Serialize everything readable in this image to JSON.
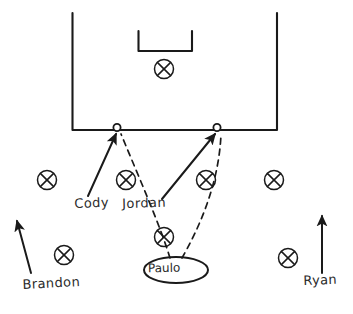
{
  "diagram": {
    "style": "hand-drawn whiteboard sketch",
    "ink_color": "#1a1a1a",
    "background_color": "#ffffff",
    "width": 353,
    "height": 314
  },
  "field": {
    "penalty_box": {
      "x": 72,
      "y": 13,
      "width": 205,
      "height": 117,
      "open_side": "top"
    },
    "goal_box": {
      "x": 138,
      "y": 31,
      "width": 54,
      "height": 20,
      "open_side": "top"
    }
  },
  "labels": {
    "cody": "Cody",
    "jordan": "Jordan",
    "brandon": "Brandon",
    "ryan": "Ryan",
    "paulo": "Paulo"
  },
  "players": [
    {
      "id": "x-goal-area",
      "marker": "circled-x",
      "cx": 164,
      "cy": 69,
      "label": ""
    },
    {
      "id": "x-left-wing",
      "marker": "circled-x",
      "cx": 47,
      "cy": 180,
      "label": ""
    },
    {
      "id": "x-cody",
      "marker": "circled-x",
      "cx": 126,
      "cy": 180,
      "label": "Cody"
    },
    {
      "id": "x-jordan",
      "marker": "circled-x",
      "cx": 206,
      "cy": 180,
      "label": "Jordan"
    },
    {
      "id": "x-right-wing",
      "marker": "circled-x",
      "cx": 274,
      "cy": 180,
      "label": ""
    },
    {
      "id": "x-center",
      "marker": "circled-x",
      "cx": 164,
      "cy": 237,
      "label": ""
    },
    {
      "id": "x-brandon",
      "marker": "circled-x",
      "cx": 64,
      "cy": 255,
      "label": "Brandon"
    },
    {
      "id": "x-ryan",
      "marker": "circled-x",
      "cx": 288,
      "cy": 258,
      "label": "Ryan"
    }
  ],
  "cones": [
    {
      "id": "cone-left",
      "cx": 117,
      "cy": 128
    },
    {
      "id": "cone-right",
      "cx": 217,
      "cy": 128
    }
  ],
  "highlight": {
    "id": "paulo-oval",
    "label": "Paulo",
    "cx": 176,
    "cy": 270,
    "rx": 32,
    "ry": 13
  },
  "movement_arrows": [
    {
      "id": "arrow-cody-run",
      "from": [
        88,
        196
      ],
      "to": [
        116,
        133
      ],
      "style": "solid"
    },
    {
      "id": "arrow-jordan-run",
      "from": [
        162,
        199
      ],
      "to": [
        215,
        133
      ],
      "style": "solid"
    },
    {
      "id": "arrow-brandon-run",
      "from": [
        31,
        273
      ],
      "to": [
        17,
        221
      ],
      "style": "solid"
    },
    {
      "id": "arrow-ryan-run",
      "from": [
        322,
        273
      ],
      "to": [
        322,
        215
      ],
      "style": "solid"
    }
  ],
  "pass_paths": [
    {
      "id": "pass-paulo-to-left-cone",
      "style": "dashed",
      "from": [
        170,
        258
      ],
      "to": [
        120,
        134
      ]
    },
    {
      "id": "pass-paulo-to-right-cone",
      "style": "dashed",
      "from": [
        182,
        258
      ],
      "to": [
        221,
        134
      ]
    }
  ],
  "legend": {
    "circled_x_meaning": "player position",
    "small_circle_meaning": "cone / target",
    "solid_arrow_meaning": "player run",
    "dashed_curve_meaning": "pass"
  }
}
